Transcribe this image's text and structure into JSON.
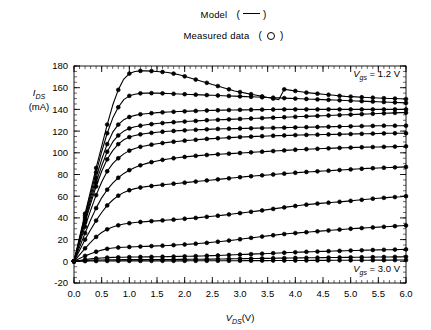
{
  "legend": {
    "model_label": "Model",
    "model_symbol": "line",
    "model_paren_open": "(",
    "model_paren_close": ")",
    "measured_label": "Measured data",
    "measured_symbol": "circle",
    "measured_paren_open": "(",
    "measured_paren_close": ")"
  },
  "axes": {
    "ylabel_main": "I",
    "ylabel_sub": "DS",
    "ylabel_units": "(mA)",
    "xlabel_main": "V",
    "xlabel_sub": "DS",
    "xlabel_units": "(V)"
  },
  "annotations": {
    "top": {
      "var": "V",
      "sub": "gs",
      "text": " = 1.2 V"
    },
    "bottom": {
      "var": "V",
      "sub": "gs",
      "text": " = 3.0 V"
    }
  },
  "colors": {
    "line": "#000000",
    "marker": "#000000",
    "axis": "#000000",
    "background": "#ffffff"
  },
  "chart_data": {
    "type": "line",
    "title": "",
    "subtitle": "",
    "xlabel": "V_DS (V)",
    "ylabel": "I_DS (mA)",
    "xlim": [
      0.0,
      6.0
    ],
    "ylim": [
      -20,
      180
    ],
    "xticks": [
      0.0,
      0.5,
      1.0,
      1.5,
      2.0,
      2.5,
      3.0,
      3.5,
      4.0,
      4.5,
      5.0,
      5.5,
      6.0
    ],
    "xticklabels": [
      "0.0",
      "0.5",
      "1.0",
      "1.5",
      "2.0",
      "2.5",
      "3.0",
      "3.5",
      "4.0",
      "4.5",
      "5.0",
      "5.5",
      "6.0"
    ],
    "yticks": [
      -20,
      0,
      20,
      40,
      60,
      80,
      100,
      120,
      140,
      160,
      180
    ],
    "yticklabels": [
      "-20",
      "0",
      "20",
      "40",
      "60",
      "80",
      "100",
      "120",
      "140",
      "160",
      "180"
    ],
    "minor_ticks": true,
    "grid": false,
    "legend_position": "above-plot-center",
    "legend_entries": [
      "Model (line)",
      "Measured data (circle)"
    ],
    "annotations": [
      "V_gs = 1.2 V (top right, topmost curve)",
      "V_gs = 3.0 V (bottom right, lowest curve)"
    ],
    "x": [
      0.0,
      0.1,
      0.2,
      0.3,
      0.4,
      0.5,
      0.6,
      0.7,
      0.8,
      0.9,
      1.0,
      1.1,
      1.2,
      1.3,
      1.4,
      1.5,
      1.6,
      1.7,
      1.8,
      1.9,
      2.0,
      2.1,
      2.2,
      2.3,
      2.4,
      2.5,
      2.6,
      2.7,
      2.8,
      2.9,
      3.0,
      3.1,
      3.2,
      3.3,
      3.4,
      3.5,
      3.6,
      3.7,
      3.8,
      3.9,
      4.0,
      4.1,
      4.2,
      4.3,
      4.4,
      4.5,
      4.6,
      4.7,
      4.8,
      4.9,
      5.0,
      5.1,
      5.2,
      5.3,
      5.4,
      5.5,
      5.6,
      5.7,
      5.8,
      5.9,
      6.0
    ],
    "series": [
      {
        "name": "Vgs = 1.2 V",
        "values": [
          0,
          22,
          44,
          65,
          86,
          106,
          126,
          144,
          158,
          168,
          173,
          175,
          175.5,
          175.5,
          175.3,
          175,
          174.5,
          174,
          173,
          172,
          170.5,
          169,
          167.5,
          166,
          164.5,
          163,
          161.5,
          160,
          158.5,
          157,
          156,
          155,
          154,
          153,
          152,
          151,
          150,
          149,
          158.5,
          157.8,
          157,
          156.2,
          155.5,
          155,
          154.5,
          154,
          153.5,
          153,
          152.5,
          152,
          151.8,
          151.5,
          151.2,
          151,
          150.8,
          150.5,
          150.3,
          150.1,
          150,
          149.8,
          149.5
        ]
      },
      {
        "name": "Vgs = 1.4 V",
        "values": [
          0,
          21,
          42,
          62,
          82,
          101,
          118,
          132,
          142,
          149,
          152.5,
          154,
          154.8,
          155,
          155,
          155,
          154.8,
          154.6,
          154.4,
          154.2,
          154,
          153.8,
          153.6,
          153.4,
          153.2,
          153,
          152.8,
          152.6,
          152.4,
          152.2,
          152,
          151.8,
          151.6,
          151.4,
          151.2,
          151,
          150.8,
          150.6,
          150.4,
          150.2,
          150,
          149.8,
          149.6,
          149.4,
          149.2,
          149,
          148.8,
          148.6,
          148.4,
          148.2,
          148,
          147.8,
          147.6,
          147.4,
          147.2,
          147,
          146.8,
          146.6,
          146.4,
          146.2,
          146
        ]
      },
      {
        "name": "Vgs = 1.6 V",
        "values": [
          0,
          20,
          40,
          59,
          77,
          94,
          108,
          119,
          126,
          130.5,
          133,
          134.5,
          135.5,
          136,
          136.5,
          137,
          137.3,
          137.6,
          137.8,
          138,
          138.2,
          138.4,
          138.6,
          138.8,
          139,
          139.1,
          139.2,
          139.3,
          139.4,
          139.5,
          139.6,
          139.6,
          139.7,
          139.8,
          139.8,
          139.9,
          139.9,
          140,
          140,
          140,
          140,
          140,
          140,
          140,
          140,
          140,
          140,
          140,
          140,
          140,
          140,
          140,
          140,
          140,
          140,
          140,
          140,
          140,
          140,
          140,
          140
        ]
      },
      {
        "name": "Vgs = 1.8 V",
        "values": [
          0,
          19,
          38,
          56,
          73,
          88,
          101,
          110,
          116,
          120,
          122.5,
          124,
          125,
          125.8,
          126.4,
          127,
          127.4,
          127.8,
          128.2,
          128.5,
          128.8,
          129.1,
          129.4,
          129.7,
          130,
          130.2,
          130.4,
          130.6,
          130.8,
          131,
          131.2,
          131.4,
          131.6,
          131.8,
          132,
          132.2,
          132.4,
          132.6,
          132.8,
          133,
          133.2,
          133.4,
          133.6,
          133.8,
          134,
          134.2,
          134.4,
          134.6,
          134.8,
          135,
          135.2,
          135.4,
          135.6,
          135.8,
          136,
          136.2,
          136.4,
          136.6,
          136.8,
          137,
          137
        ]
      },
      {
        "name": "Vgs = 2.0 V",
        "values": [
          0,
          18,
          36,
          53,
          69,
          83,
          94,
          102,
          108,
          112,
          114.5,
          116,
          117,
          117.8,
          118.4,
          119,
          119.4,
          119.8,
          120.1,
          120.4,
          120.7,
          121,
          121.2,
          121.4,
          121.6,
          121.8,
          122,
          122.1,
          122.2,
          122.3,
          122.4,
          122.5,
          122.6,
          122.7,
          122.8,
          122.9,
          123,
          123.1,
          123.2,
          123.3,
          123.4,
          123.5,
          123.6,
          123.7,
          123.8,
          123.9,
          124,
          124.1,
          124.2,
          124.3,
          124.4,
          124.5,
          124.6,
          124.7,
          124.8,
          124.9,
          125,
          125,
          125,
          125,
          125
        ]
      },
      {
        "name": "Vgs = 2.1 V",
        "values": [
          0,
          16,
          32,
          47,
          61,
          73,
          83,
          90,
          95,
          99,
          102,
          104,
          105.5,
          106.5,
          107.5,
          108.3,
          109,
          109.6,
          110.2,
          110.7,
          111.2,
          111.6,
          112,
          112.4,
          112.8,
          113.1,
          113.4,
          113.7,
          114,
          114.2,
          114.5,
          114.7,
          114.9,
          115.1,
          115.3,
          115.5,
          115.7,
          115.8,
          116,
          116.1,
          116.3,
          116.4,
          116.5,
          116.6,
          116.7,
          116.8,
          116.9,
          117,
          117.1,
          117.2,
          117.3,
          117.4,
          117.5,
          117.6,
          117.7,
          117.8,
          117.9,
          118,
          118,
          118,
          118
        ]
      },
      {
        "name": "Vgs = 2.2 V",
        "values": [
          0,
          13,
          26,
          38,
          49,
          58.5,
          66,
          72,
          77,
          81,
          84,
          86.5,
          88.5,
          90,
          91.4,
          92.5,
          93.5,
          94.3,
          95,
          95.6,
          96.2,
          96.7,
          97.2,
          97.6,
          98,
          98.3,
          98.6,
          98.9,
          99.2,
          99.5,
          99.8,
          100.1,
          100.4,
          100.7,
          101,
          101.3,
          101.6,
          101.9,
          102.2,
          102.5,
          102.8,
          103.1,
          103.3,
          103.5,
          103.7,
          103.9,
          104.1,
          104.3,
          104.5,
          104.7,
          104.8,
          105,
          105.1,
          105.2,
          105.3,
          105.4,
          105.5,
          105.6,
          105.7,
          105.8,
          106
        ]
      },
      {
        "name": "Vgs = 2.3 V",
        "values": [
          0,
          10,
          20,
          29,
          37.5,
          45,
          51.5,
          56.5,
          60.5,
          63.5,
          65.5,
          67,
          68,
          68.8,
          69.4,
          70,
          70.5,
          71,
          71.5,
          72,
          72.5,
          73,
          73.5,
          74,
          74.5,
          75,
          75.5,
          76,
          76.5,
          77,
          77.5,
          78,
          78.4,
          78.8,
          79.2,
          79.6,
          80,
          80.4,
          80.8,
          81.2,
          81.6,
          82,
          82.3,
          82.6,
          82.9,
          83.2,
          83.5,
          83.8,
          84.1,
          84.4,
          84.7,
          85,
          85.3,
          85.6,
          85.8,
          86,
          86.2,
          86.4,
          86.6,
          86.8,
          87
        ]
      },
      {
        "name": "Vgs = 2.4 V",
        "values": [
          0,
          6,
          12,
          17.5,
          22.5,
          26.5,
          29.5,
          31.7,
          33.2,
          34.3,
          35.1,
          35.7,
          36.2,
          36.6,
          37,
          37.3,
          37.7,
          38,
          38.4,
          38.8,
          39.2,
          39.6,
          40,
          40.5,
          41,
          41.5,
          42,
          42.6,
          43.2,
          43.8,
          44.4,
          45,
          45.6,
          46.2,
          46.9,
          47.6,
          48.3,
          49,
          49.7,
          50.4,
          51,
          51.6,
          52.2,
          52.7,
          53.2,
          53.6,
          54,
          54.4,
          54.8,
          55.2,
          55.7,
          56.2,
          56.7,
          57.2,
          57.7,
          58.1,
          58.5,
          58.9,
          59.2,
          59.5,
          60
        ]
      },
      {
        "name": "Vgs = 2.6 V",
        "values": [
          0,
          2.5,
          5,
          7,
          8.8,
          10.3,
          11.5,
          12.2,
          12.7,
          13,
          13.2,
          13.4,
          13.6,
          13.8,
          14,
          14.2,
          14.4,
          14.6,
          14.9,
          15.2,
          15.5,
          15.8,
          16.2,
          16.6,
          17,
          17.5,
          18,
          18.5,
          19.1,
          19.7,
          20.3,
          21,
          21.6,
          22.2,
          22.8,
          23.4,
          24,
          24.6,
          25.1,
          25.6,
          26,
          26.4,
          26.8,
          27.2,
          27.6,
          28,
          28.4,
          28.8,
          29.2,
          29.6,
          30,
          30.3,
          30.6,
          30.9,
          31.2,
          31.5,
          31.8,
          32.1,
          32.4,
          32.7,
          33
        ]
      },
      {
        "name": "Vgs = 2.8 V",
        "values": [
          0,
          0.8,
          1.6,
          2.2,
          2.7,
          3.1,
          3.4,
          3.6,
          3.7,
          3.8,
          3.9,
          3.95,
          4,
          4.05,
          4.1,
          4.15,
          4.2,
          4.3,
          4.4,
          4.5,
          4.6,
          4.7,
          4.8,
          4.95,
          5.1,
          5.25,
          5.4,
          5.6,
          5.8,
          6,
          6.2,
          6.4,
          6.6,
          6.8,
          7,
          7.2,
          7.45,
          7.7,
          7.9,
          8.1,
          8.3,
          8.5,
          8.7,
          8.85,
          9,
          9.15,
          9.3,
          9.45,
          9.6,
          9.75,
          9.9,
          10,
          10.15,
          10.3,
          10.4,
          10.5,
          10.6,
          10.7,
          10.8,
          10.9,
          11
        ]
      },
      {
        "name": "Vgs = 2.9 V",
        "values": [
          0,
          0.35,
          0.65,
          0.9,
          1.1,
          1.25,
          1.35,
          1.4,
          1.45,
          1.5,
          1.52,
          1.54,
          1.56,
          1.58,
          1.6,
          1.62,
          1.65,
          1.68,
          1.72,
          1.76,
          1.8,
          1.84,
          1.88,
          1.93,
          1.98,
          2.04,
          2.1,
          2.17,
          2.24,
          2.31,
          2.38,
          2.45,
          2.52,
          2.59,
          2.66,
          2.74,
          2.82,
          2.9,
          2.97,
          3.04,
          3.1,
          3.16,
          3.22,
          3.28,
          3.34,
          3.4,
          3.45,
          3.5,
          3.55,
          3.6,
          3.65,
          3.7,
          3.75,
          3.8,
          3.85,
          3.9,
          3.95,
          4,
          4.05,
          4.1,
          4.15
        ]
      },
      {
        "name": "Vgs = 3.0 V",
        "values": [
          0,
          0.1,
          0.18,
          0.24,
          0.28,
          0.31,
          0.33,
          0.35,
          0.36,
          0.37,
          0.38,
          0.38,
          0.39,
          0.39,
          0.4,
          0.4,
          0.41,
          0.41,
          0.42,
          0.42,
          0.43,
          0.44,
          0.45,
          0.46,
          0.47,
          0.48,
          0.49,
          0.5,
          0.52,
          0.54,
          0.56,
          0.58,
          0.6,
          0.62,
          0.64,
          0.66,
          0.68,
          0.7,
          0.72,
          0.74,
          0.76,
          0.78,
          0.8,
          0.82,
          0.84,
          0.86,
          0.88,
          0.9,
          0.92,
          0.94,
          0.96,
          0.98,
          1,
          1.02,
          1.04,
          1.06,
          1.08,
          1.1,
          1.12,
          1.14,
          1.16
        ]
      }
    ]
  }
}
